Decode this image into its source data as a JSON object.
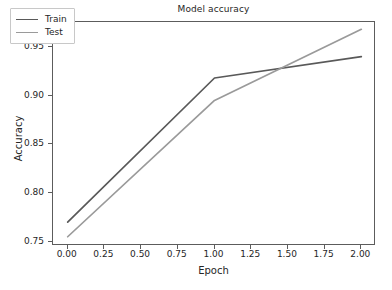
{
  "chart_data": {
    "type": "line",
    "title": "Model accuracy",
    "xlabel": "Epoch",
    "ylabel": "Accuracy",
    "x": [
      0,
      1,
      2
    ],
    "series": [
      {
        "name": "Train",
        "values": [
          0.77,
          0.918,
          0.94
        ],
        "color": "#595959"
      },
      {
        "name": "Test",
        "values": [
          0.755,
          0.895,
          0.968
        ],
        "color": "#9a9a9a"
      }
    ],
    "xlim": [
      -0.1,
      2.1
    ],
    "ylim": [
      0.7455,
      0.9755
    ],
    "xticks": [
      0.0,
      0.25,
      0.5,
      0.75,
      1.0,
      1.25,
      1.5,
      1.75,
      2.0
    ],
    "xtick_labels": [
      "0.00",
      "0.25",
      "0.50",
      "0.75",
      "1.00",
      "1.25",
      "1.50",
      "1.75",
      "2.00"
    ],
    "yticks": [
      0.75,
      0.8,
      0.85,
      0.9,
      0.95
    ],
    "ytick_labels": [
      "0.75",
      "0.80",
      "0.85",
      "0.90",
      "0.95"
    ],
    "grid": false,
    "legend_position": "upper left",
    "legend_entries": [
      "Train",
      "Test"
    ],
    "frame_color": "#5c5c5c",
    "background": "#ffffff"
  }
}
